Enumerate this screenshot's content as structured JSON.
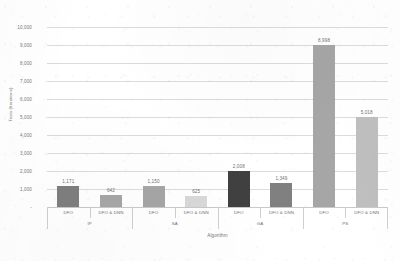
{
  "chart_data": {
    "type": "bar",
    "title": "",
    "xlabel": "Algorithm",
    "ylabel": "Tests (Iterations)",
    "ylim": [
      0,
      10000
    ],
    "ytick_step": 1000,
    "grid": true,
    "legend": "none",
    "group_labels": [
      "IP",
      "SA",
      "GA",
      "PS"
    ],
    "subcategory_labels": [
      "DFO",
      "DFO & DNN"
    ],
    "categories": [
      "IP / DFO",
      "IP / DFO & DNN",
      "SA / DFO",
      "SA / DFO & DNN",
      "GA / DFO",
      "GA / DFO & DNN",
      "PS / DFO",
      "PS / DFO & DNN"
    ],
    "values": [
      1171,
      642,
      1150,
      625,
      2008,
      1349,
      8998,
      5018
    ],
    "value_labels": [
      "1,171",
      "642",
      "1,150",
      "625",
      "2,008",
      "1,349",
      "8,998",
      "5,018"
    ],
    "bar_colors": [
      "#7f7f7f",
      "#a6a6a6",
      "#a6a6a6",
      "#d9d9d9",
      "#404040",
      "#808080",
      "#a6a6a6",
      "#bfbfbf"
    ],
    "ytick_labels": [
      "10,000",
      "9,000",
      "8,000",
      "7,000",
      "6,000",
      "5,000",
      "4,000",
      "3,000",
      "2,000",
      "1,000",
      "-"
    ],
    "ytick_values": [
      10000,
      9000,
      8000,
      7000,
      6000,
      5000,
      4000,
      3000,
      2000,
      1000,
      0
    ]
  },
  "colors": {
    "gridline": "#dcdcdc",
    "text": "#737373",
    "background": "#ffffff"
  }
}
